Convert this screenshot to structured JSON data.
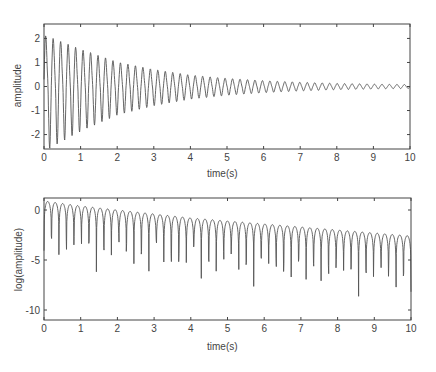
{
  "chart_data": [
    {
      "type": "line",
      "title": "",
      "xlabel": "time(s)",
      "ylabel": "amplitude",
      "xlim": [
        0,
        10
      ],
      "ylim": [
        -2.6,
        2.6
      ],
      "xticks": [
        "0",
        "1",
        "2",
        "3",
        "4",
        "5",
        "6",
        "7",
        "8",
        "9",
        "10"
      ],
      "yticks": [
        "-2",
        "-1",
        "0",
        "1",
        "2"
      ],
      "grid": false,
      "description": "Decaying oscillation; peaks about 2.4 near t=0.1 decaying to ~0.1 by t=10; ~5 oscillations per second with interleaved smaller component",
      "envelope": {
        "t": [
          0,
          1,
          2,
          3,
          4,
          5,
          6,
          7,
          8,
          9,
          10
        ],
        "amp": [
          2.4,
          1.7,
          1.1,
          0.75,
          0.5,
          0.35,
          0.25,
          0.18,
          0.13,
          0.1,
          0.08
        ]
      }
    },
    {
      "type": "line",
      "title": "",
      "xlabel": "time(s)",
      "ylabel": "log(amplitude)",
      "xlim": [
        0,
        10
      ],
      "ylim": [
        -11,
        1.2
      ],
      "xticks": [
        "0",
        "1",
        "2",
        "3",
        "4",
        "5",
        "6",
        "7",
        "8",
        "9",
        "10"
      ],
      "yticks": [
        "-10",
        "-5",
        "0"
      ],
      "grid": false,
      "description": "Log of absolute amplitude; upper envelope from ~0.9 at t=0 to ~-2.6 at t=10, with deep dips down to ~-10.5 near t=6.5",
      "envelope": {
        "t": [
          0,
          1,
          2,
          3,
          4,
          5,
          6,
          7,
          8,
          9,
          10
        ],
        "upper": [
          0.9,
          0.4,
          0.0,
          -0.4,
          -0.8,
          -1.1,
          -1.4,
          -1.7,
          -2.0,
          -2.3,
          -2.6
        ]
      }
    }
  ],
  "labels": {
    "top_xlabel": "time(s)",
    "top_ylabel": "amplitude",
    "bottom_xlabel": "time(s)",
    "bottom_ylabel": "log(amplitude)"
  }
}
